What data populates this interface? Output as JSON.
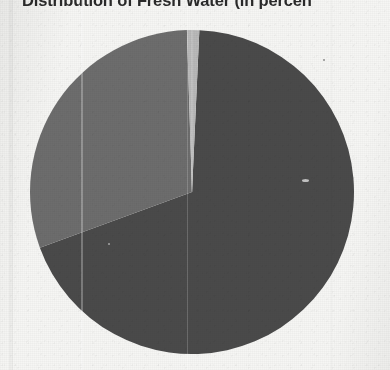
{
  "document": {
    "kind": "scanned-page",
    "background_color": "#f6f6f4"
  },
  "chart_data": {
    "type": "pie",
    "title": "Distribution of Fresh Water (in percen",
    "title_note": "title is cropped at the top edge and truncated at the right edge of the scan",
    "xlabel": "",
    "ylabel": "",
    "legend": "none",
    "grid": false,
    "labels": [
      "Glaciers and Ice Caps",
      "Ground Water",
      "Surface Water"
    ],
    "values": [
      68.7,
      30.1,
      1.2
    ],
    "colors": [
      "#4a4a4a",
      "#6d6d6d",
      "#b9b9b9"
    ],
    "slices": [
      {
        "label": "Glaciers and Ice Caps",
        "value": 68.7,
        "color": "#4a4a4a",
        "start_deg": 2.6,
        "end_deg": 249.9
      },
      {
        "label": "Ground Water",
        "value": 30.1,
        "color": "#6d6d6d",
        "start_deg": 249.9,
        "end_deg": 358.2
      },
      {
        "label": "Surface Water",
        "value": 1.2,
        "color": "#b9b9b9",
        "start_deg": 358.2,
        "end_deg": 362.6
      }
    ],
    "geometry": {
      "center_x": 192,
      "center_y": 192,
      "radius": 162
    },
    "data_labels_shown": false
  }
}
